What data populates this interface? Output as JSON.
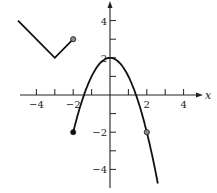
{
  "chart_data": {
    "type": "line",
    "title": "",
    "xlabel": "x",
    "ylabel": "",
    "xlim": [
      -5,
      5
    ],
    "ylim": [
      -5,
      5
    ],
    "grid": false,
    "x_ticks": [
      -4,
      -3,
      -2,
      -1,
      1,
      2,
      3,
      4
    ],
    "x_tick_labels": [
      {
        "value": -4,
        "label": "−4"
      },
      {
        "value": -2,
        "label": "−2"
      },
      {
        "value": 2,
        "label": "2"
      },
      {
        "value": 4,
        "label": "4"
      }
    ],
    "y_ticks": [
      -4,
      -3,
      -2,
      -1,
      1,
      2,
      3,
      4
    ],
    "y_tick_labels": [
      {
        "value": 4,
        "label": "4"
      },
      {
        "value": 2,
        "label": "2"
      },
      {
        "value": -2,
        "label": "−2"
      },
      {
        "value": -4,
        "label": "−4"
      }
    ],
    "series": [
      {
        "name": "piece-1 absolute value",
        "kind": "polyline",
        "points": [
          [
            -5,
            4
          ],
          [
            -3,
            2
          ],
          [
            -2,
            3
          ]
        ],
        "endpoints": [
          {
            "x": -2,
            "y": 3,
            "style": "open"
          }
        ]
      },
      {
        "name": "piece-2 parabola y = 2 - x^2",
        "kind": "function",
        "formula": "2 - x^2",
        "domain": [
          -2,
          2.6
        ],
        "endpoints": [
          {
            "x": -2,
            "y": -2,
            "style": "closed"
          }
        ],
        "marked_points": [
          {
            "x": 2,
            "y": -2,
            "style": "open"
          }
        ]
      }
    ]
  },
  "colors": {
    "line": "#111111",
    "open_dot_fill": "#8a8a8a",
    "closed_dot_fill": "#111111"
  }
}
